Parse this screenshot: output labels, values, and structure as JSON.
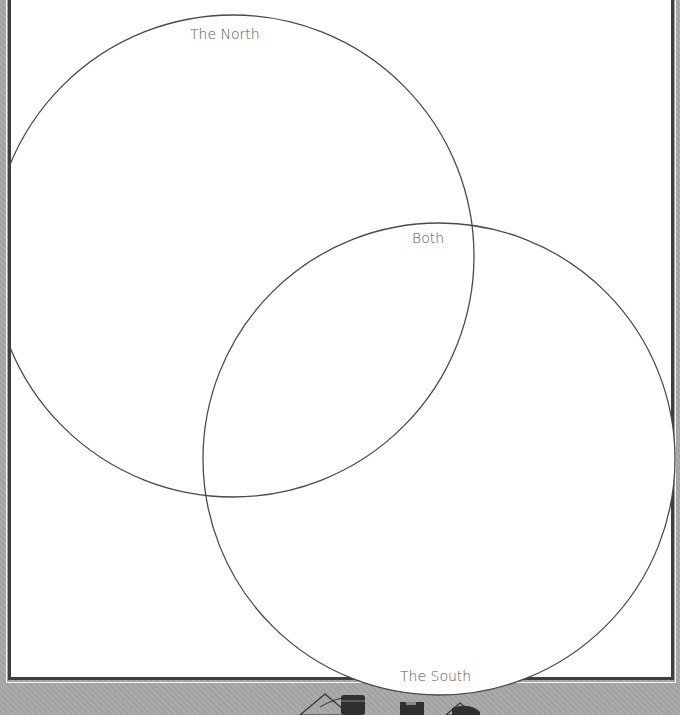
{
  "diagram": {
    "type": "venn",
    "circles": [
      {
        "id": "north",
        "label": "The North",
        "cx": 233,
        "cy": 256,
        "r": 241
      },
      {
        "id": "south",
        "label": "The South",
        "cx": 439,
        "cy": 459,
        "r": 236
      }
    ],
    "intersection_label": "Both"
  },
  "colors": {
    "page_background": "#a8a8a8",
    "frame_border": "#3e3e3e",
    "frame_fill": "#ffffff",
    "circle_stroke": "#4a4a4a",
    "label_text": "#555555",
    "decor_dark": "#2f2f2f"
  },
  "decorations": {
    "bottom_icons": [
      "triangle-outline-icon",
      "barrel-icon",
      "box-icon",
      "triangle-outline-icon",
      "dark-shape-icon"
    ]
  }
}
